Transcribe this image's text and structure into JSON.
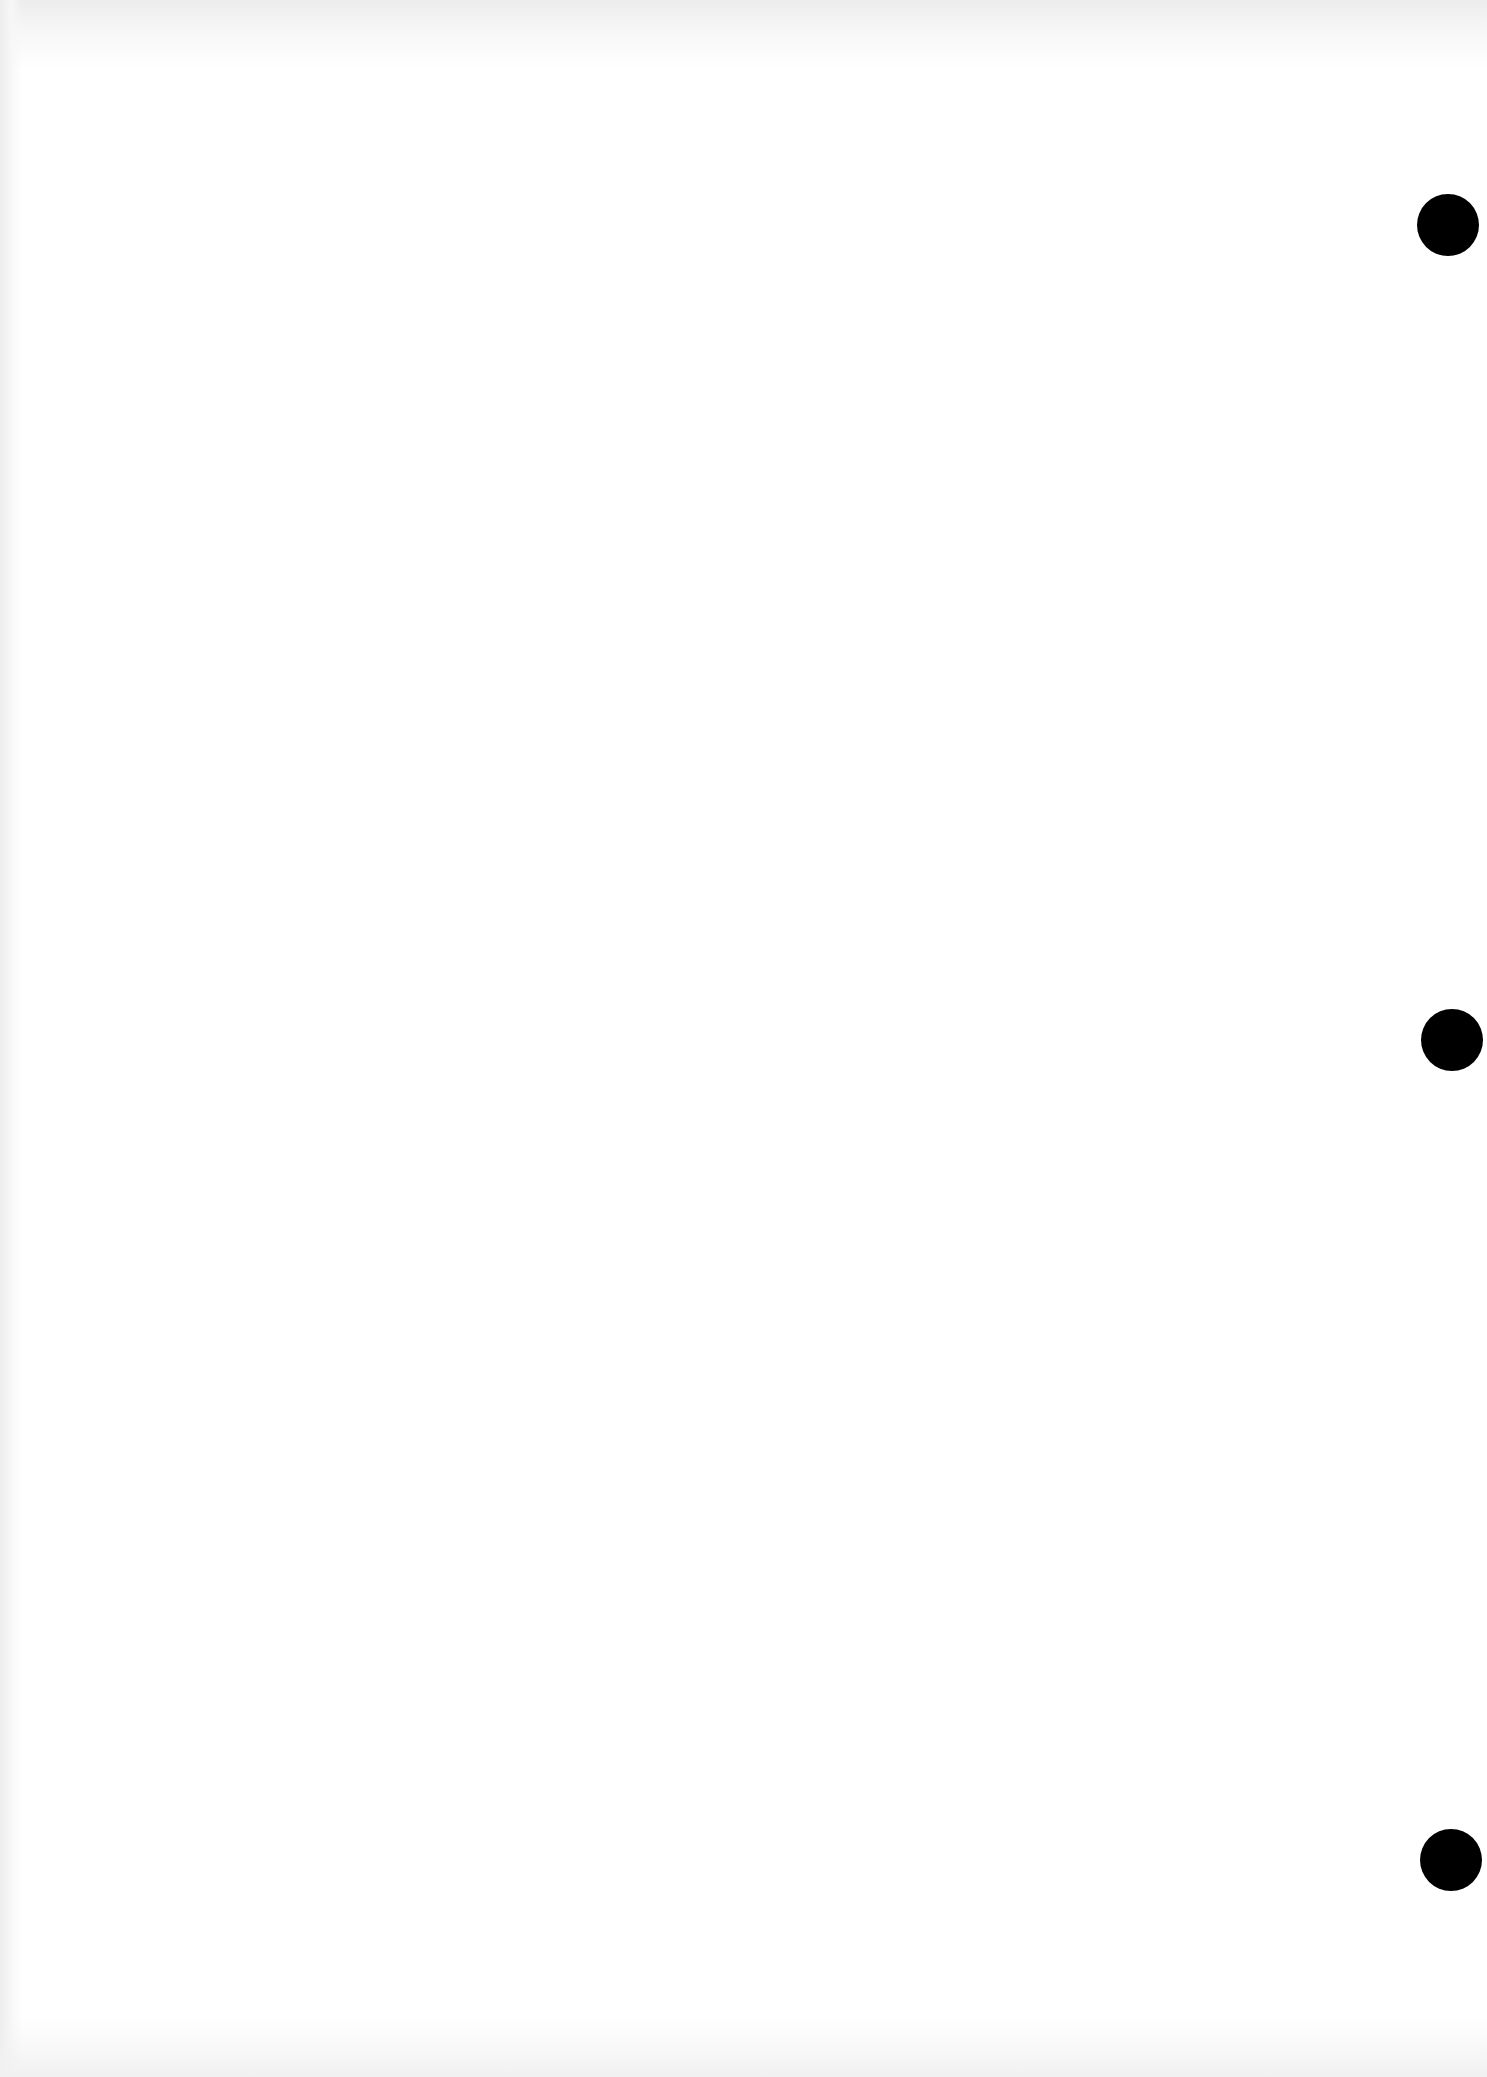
{
  "page": {
    "type": "blank scanned page",
    "text": "",
    "background_color": "#ffffff",
    "punch_holes": [
      {
        "cx": 1448,
        "cy": 225,
        "r": 31,
        "color": "#000000"
      },
      {
        "cx": 1452,
        "cy": 1040,
        "r": 31,
        "color": "#000000"
      },
      {
        "cx": 1451,
        "cy": 1860,
        "r": 31,
        "color": "#000000"
      }
    ]
  }
}
